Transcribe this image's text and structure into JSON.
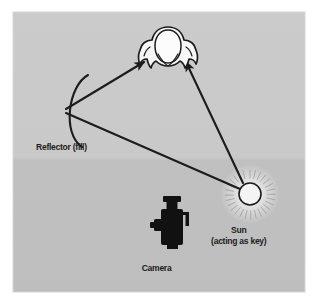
{
  "figure": {
    "background_color": "#ffffff",
    "panel_color_upper": "#c9c9c9",
    "panel_color_lower": "#c2c2c2",
    "ink_color": "#1c1c1c"
  },
  "labels": {
    "reflector": "Reflector (fill)",
    "sun_line1": "Sun",
    "sun_line2": "(acting as key)",
    "camera": "Camera"
  },
  "elements": {
    "subject": {
      "name": "subject-head-top-view",
      "fill": "#f7f7f7",
      "stroke": "#1c1c1c",
      "center_x": 168,
      "center_y": 50
    },
    "sun": {
      "name": "sun-source",
      "fill": "#f4f4f4",
      "stroke": "#1c1c1c",
      "center_x": 250,
      "center_y": 194,
      "radius": 11,
      "ray_count": 28
    },
    "reflector": {
      "name": "reflector-arc",
      "stroke": "#1c1c1c",
      "vertex_x": 64,
      "vertex_y": 111
    },
    "camera": {
      "name": "camera-silhouette",
      "fill": "#101010",
      "center_x": 172,
      "center_y": 226
    }
  },
  "light_paths": [
    {
      "name": "sun-to-subject",
      "from": "sun",
      "to": "subject",
      "arrow": "end"
    },
    {
      "name": "sun-to-reflector",
      "from": "sun",
      "to": "reflector",
      "arrow": "none"
    },
    {
      "name": "reflector-to-subject",
      "from": "reflector",
      "to": "subject",
      "arrow": "end"
    }
  ]
}
